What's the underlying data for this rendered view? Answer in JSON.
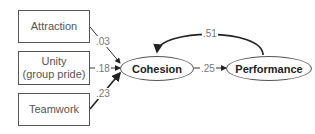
{
  "diagram": {
    "predictors": [
      {
        "label": "Attraction"
      },
      {
        "label": "Unity\n(group pride)",
        "line1": "Unity",
        "line2": "(group pride)"
      },
      {
        "label": "Teamwork"
      }
    ],
    "nodes": {
      "cohesion": "Cohesion",
      "performance": "Performance"
    },
    "paths": {
      "attraction_to_cohesion": ".03",
      "unity_to_cohesion": ".18",
      "teamwork_to_cohesion": ".23",
      "cohesion_to_performance": ".25",
      "performance_to_cohesion": ".51"
    }
  }
}
